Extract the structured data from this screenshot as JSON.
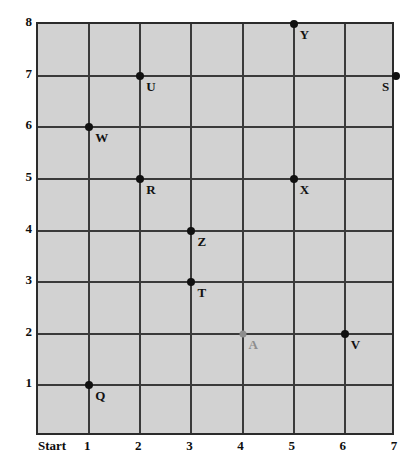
{
  "chart_data": {
    "type": "scatter",
    "title": "",
    "xlabel": "",
    "ylabel": "",
    "xlim": [
      0,
      7
    ],
    "ylim": [
      0,
      8
    ],
    "grid": true,
    "legend": false,
    "x_tick_labels": [
      "Start",
      "1",
      "2",
      "3",
      "4",
      "5",
      "6",
      "7"
    ],
    "y_tick_labels": [
      "1",
      "2",
      "3",
      "4",
      "5",
      "6",
      "7",
      "8"
    ],
    "x_ticks": [
      0,
      1,
      2,
      3,
      4,
      5,
      6,
      7
    ],
    "y_ticks": [
      1,
      2,
      3,
      4,
      5,
      6,
      7,
      8
    ],
    "background_color": "#d2d2d2",
    "grid_color": "#3a3a3a",
    "marker_color": "#111111",
    "highlight_color": "#8d8d8d",
    "points": [
      {
        "label": "Y",
        "x": 5,
        "y": 8,
        "color": "#111111",
        "label_dx": 6,
        "label_dy": 4
      },
      {
        "label": "S",
        "x": 7,
        "y": 7,
        "color": "#111111",
        "label_dx": -14,
        "label_dy": 4
      },
      {
        "label": "U",
        "x": 2,
        "y": 7,
        "color": "#111111",
        "label_dx": 6,
        "label_dy": 4
      },
      {
        "label": "W",
        "x": 1,
        "y": 6,
        "color": "#111111",
        "label_dx": 6,
        "label_dy": 4
      },
      {
        "label": "R",
        "x": 2,
        "y": 5,
        "color": "#111111",
        "label_dx": 6,
        "label_dy": 4
      },
      {
        "label": "X",
        "x": 5,
        "y": 5,
        "color": "#111111",
        "label_dx": 6,
        "label_dy": 4
      },
      {
        "label": "Z",
        "x": 3,
        "y": 4,
        "color": "#111111",
        "label_dx": 6,
        "label_dy": 4
      },
      {
        "label": "T",
        "x": 3,
        "y": 3,
        "color": "#111111",
        "label_dx": 6,
        "label_dy": 4
      },
      {
        "label": "A",
        "x": 4,
        "y": 2,
        "color": "#8d8d8d",
        "label_dx": 6,
        "label_dy": 4
      },
      {
        "label": "V",
        "x": 6,
        "y": 2,
        "color": "#111111",
        "label_dx": 6,
        "label_dy": 4
      },
      {
        "label": "Q",
        "x": 1,
        "y": 1,
        "color": "#111111",
        "label_dx": 6,
        "label_dy": 4
      }
    ]
  }
}
